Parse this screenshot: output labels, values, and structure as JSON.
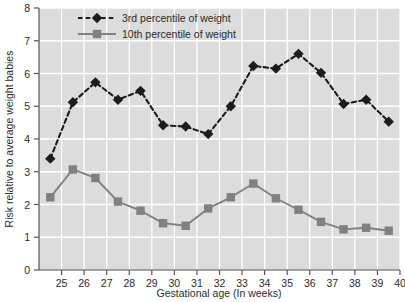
{
  "chart_data": {
    "type": "line",
    "title": "",
    "xlabel": "Gestational age (In weeks)",
    "ylabel": "Risk relative to average weight babies",
    "xlim": [
      24,
      40
    ],
    "ylim": [
      0,
      8
    ],
    "xticks": [
      25,
      26,
      27,
      28,
      29,
      30,
      31,
      32,
      33,
      34,
      35,
      36,
      37,
      38,
      39,
      40
    ],
    "yticks": [
      0,
      1,
      2,
      3,
      4,
      5,
      6,
      7,
      8
    ],
    "grid": true,
    "legend_position": "top-center",
    "x": [
      24.5,
      25.5,
      26.5,
      27.5,
      28.5,
      29.5,
      30.5,
      31.5,
      32.5,
      33.5,
      34.5,
      35.5,
      36.5,
      37.5,
      38.5,
      39.5
    ],
    "series": [
      {
        "name": "3rd percentile of weight",
        "marker": "diamond",
        "linestyle": "dashed",
        "color": "#1c1c1c",
        "values": [
          3.4,
          5.12,
          5.73,
          5.2,
          5.47,
          4.42,
          4.38,
          4.15,
          5.0,
          6.23,
          6.15,
          6.6,
          6.02,
          5.07,
          5.2,
          4.53
        ]
      },
      {
        "name": "10th percentile of weight",
        "marker": "square",
        "linestyle": "solid",
        "color": "#808080",
        "values": [
          2.22,
          3.07,
          2.81,
          2.09,
          1.81,
          1.43,
          1.35,
          1.88,
          2.22,
          2.64,
          2.19,
          1.84,
          1.47,
          1.24,
          1.29,
          1.2
        ]
      }
    ]
  },
  "colors": {
    "plot_background": "#dcdcdc",
    "gridline": "#ffffff",
    "axis": "#555555",
    "series_3rd": "#1c1c1c",
    "series_10th": "#808080",
    "page_background": "#ffffff"
  },
  "legend": {
    "items": [
      {
        "label": "3rd percentile of weight"
      },
      {
        "label": "10th percentile of weight"
      }
    ]
  },
  "axes": {
    "x": {
      "title": "Gestational age (In weeks)",
      "tick_labels": [
        "25",
        "26",
        "27",
        "28",
        "29",
        "30",
        "31",
        "32",
        "33",
        "34",
        "35",
        "36",
        "37",
        "38",
        "39",
        "40"
      ]
    },
    "y": {
      "title": "Risk relative to average weight babies",
      "tick_labels": [
        "0",
        "1",
        "2",
        "3",
        "4",
        "5",
        "6",
        "7",
        "8"
      ]
    }
  }
}
